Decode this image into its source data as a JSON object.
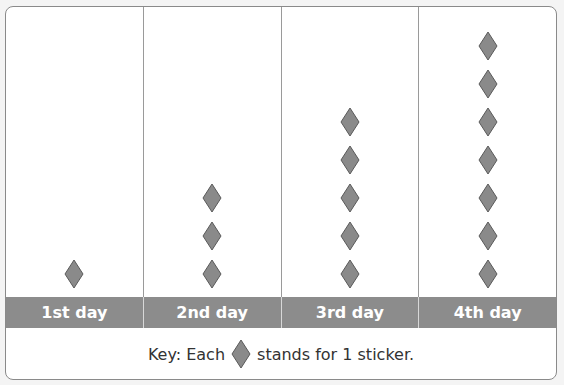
{
  "chart_data": {
    "type": "pictograph",
    "title": "",
    "categories": [
      "1st day",
      "2nd day",
      "3rd day",
      "4th day"
    ],
    "values": [
      1,
      3,
      5,
      7
    ],
    "unit": "sticker",
    "key": {
      "prefix": "Key: Each",
      "suffix": "stands for 1 sticker.",
      "icon": "diamond-icon",
      "value": 1
    },
    "colors": {
      "icon_fill": "#8a8a8a",
      "icon_stroke": "#5a5a5a",
      "label_band": "#8c8c8c",
      "label_text": "#ffffff"
    }
  }
}
